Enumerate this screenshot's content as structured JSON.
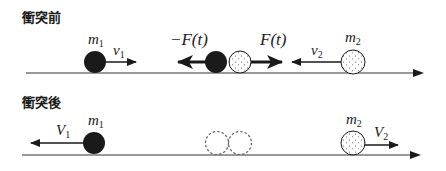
{
  "diagram": {
    "colors": {
      "line": "#777777",
      "ink": "#1a1a1a",
      "ball_dark": "#1a1a1a",
      "ball_light": "#ffffff",
      "dashed": "#666666"
    },
    "before": {
      "title": "衝突前",
      "m1": {
        "label": "m",
        "sub": "1",
        "velocity_label": "v",
        "velocity_sub": "1",
        "direction": "right"
      },
      "collision": {
        "force_left_label": "−F(t)",
        "force_right_label": "F(t)"
      },
      "m2": {
        "label": "m",
        "sub": "2",
        "velocity_label": "v",
        "velocity_sub": "2",
        "direction": "left"
      }
    },
    "after": {
      "title": "衝突後",
      "m1": {
        "label": "m",
        "sub": "1",
        "velocity_label": "V",
        "velocity_sub": "1",
        "direction": "left"
      },
      "ghost_collision_label": "",
      "m2": {
        "label": "m",
        "sub": "2",
        "velocity_label": "V",
        "velocity_sub": "2",
        "direction": "right"
      }
    }
  }
}
